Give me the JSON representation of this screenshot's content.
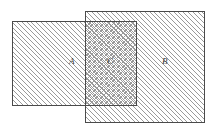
{
  "figure": {
    "width": 217,
    "height": 134,
    "background": "#ffffff",
    "kind": "set-diagram"
  },
  "style": {
    "border_color": "#4a4a4a",
    "hatch_color": "#9a9a9a",
    "label_color": "#3a3a3a",
    "hatch_angle_primary_deg": 45,
    "hatch_angle_secondary_deg": -45,
    "hatch_spacing_px": 3.4,
    "hatch_line_width_px": 0.7,
    "border_width_px": 1,
    "label_font_size_px": 9,
    "label_font_style": "italic"
  },
  "regions": [
    {
      "id": "A",
      "label": "A",
      "name": "set-a-rectangle",
      "x": 12,
      "y": 21,
      "width": 125,
      "height": 85,
      "fill": "diagonal-hatch",
      "label_x": 73,
      "label_y": 62
    },
    {
      "id": "B",
      "label": "B",
      "name": "set-b-rectangle",
      "x": 85,
      "y": 11,
      "width": 120,
      "height": 112,
      "fill": "diagonal-hatch",
      "label_x": 166,
      "label_y": 62
    },
    {
      "id": "C",
      "label": "C",
      "name": "intersection-region",
      "x": 85,
      "y": 21,
      "width": 52,
      "height": 85,
      "fill": "cross-hatch",
      "label_x": 111,
      "label_y": 62
    }
  ],
  "labels": {
    "a": "A",
    "b": "B",
    "c": "C"
  }
}
